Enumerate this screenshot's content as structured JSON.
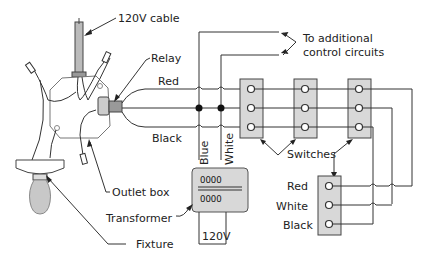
{
  "diagram": {
    "labels": {
      "cable": "120V cable",
      "relay": "Relay",
      "red": "Red",
      "black": "Black",
      "blue": "Blue",
      "white": "White",
      "additional": "To additional",
      "additional2": "control circuits",
      "switches": "Switches",
      "outlet_box": "Outlet box",
      "transformer": "Transformer",
      "fixture": "Fixture",
      "v120": "120V",
      "sw_red": "Red",
      "sw_white": "White",
      "sw_black": "Black"
    },
    "components": [
      {
        "name": "120V cable",
        "type": "cable"
      },
      {
        "name": "Relay",
        "type": "relay"
      },
      {
        "name": "Outlet box",
        "type": "junction-box"
      },
      {
        "name": "Fixture",
        "type": "light-fixture"
      },
      {
        "name": "Transformer",
        "type": "transformer",
        "input": "120V"
      },
      {
        "name": "Switches",
        "type": "switch-plate",
        "count": 4,
        "terminals": [
          "Red",
          "White",
          "Black"
        ]
      }
    ],
    "colors": {
      "line": "#333333",
      "plate_fill": "#d8d8d8",
      "background": "#ffffff"
    }
  }
}
